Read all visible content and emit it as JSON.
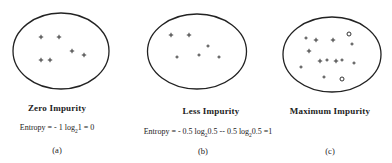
{
  "panels": [
    {
      "id": "a",
      "title": "Zero Impurity",
      "formula": "Entropy = - 1 log₂1 = 0",
      "label": "(a)",
      "markers": [
        {
          "type": "plus"
        },
        {
          "type": "plus"
        },
        {
          "type": "plus"
        },
        {
          "type": "plus"
        },
        {
          "type": "plus"
        },
        {
          "type": "plus"
        }
      ]
    },
    {
      "id": "b",
      "title": "Less Impurity",
      "formula": "Entropy = - 0.5 log₂0.5 -- 0.5 log₂0.5 =1",
      "label": "(b)",
      "markers": [
        {
          "type": "plus"
        },
        {
          "type": "plus"
        },
        {
          "type": "dot"
        },
        {
          "type": "dot"
        },
        {
          "type": "dot"
        },
        {
          "type": "dot"
        }
      ]
    },
    {
      "id": "c",
      "title": "Maximum Impurity",
      "formula": "",
      "label": "(c)",
      "markers": [
        {
          "type": "dot"
        },
        {
          "type": "plus"
        },
        {
          "type": "plus"
        },
        {
          "type": "circle"
        },
        {
          "type": "dot"
        },
        {
          "type": "plus"
        },
        {
          "type": "plus"
        },
        {
          "type": "dot"
        },
        {
          "type": "plus"
        },
        {
          "type": "dot"
        },
        {
          "type": "dot"
        },
        {
          "type": "dot"
        },
        {
          "type": "dot"
        },
        {
          "type": "circle"
        }
      ]
    }
  ]
}
